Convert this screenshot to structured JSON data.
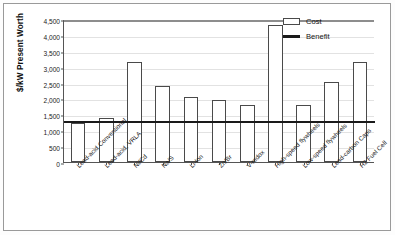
{
  "chart_data": {
    "type": "bar",
    "title": "",
    "xlabel": "",
    "ylabel": "$/kW Present Worth",
    "ylim": [
      0,
      4500
    ],
    "ytick_step": 500,
    "ytick_labels": [
      "4,500",
      "4,000",
      "3,500",
      "3,000",
      "2,500",
      "2,000",
      "1,500",
      "1,000",
      "500",
      "0"
    ],
    "ytick_values": [
      4500,
      4000,
      3500,
      3000,
      2500,
      2000,
      1500,
      1000,
      500,
      0
    ],
    "grid": true,
    "legend_position": "top-right",
    "categories": [
      "Lead-acid Conventional",
      "Lead-acid, VRLA",
      "Ni/Cd",
      "Na/S",
      "Li-Ion",
      "Zn/Br",
      "V-redox",
      "High-speed flywheels",
      "Low-speed flywheels",
      "Lead-carbon Caps",
      "H2 Fuel Cell"
    ],
    "series": [
      {
        "name": "Cost",
        "type": "bar",
        "color": "#ffffff",
        "edge_color": "#4a4a4a",
        "values": [
          1230,
          1380,
          3150,
          2380,
          2050,
          1960,
          1780,
          4300,
          1800,
          2520,
          3150
        ]
      },
      {
        "name": "Benefit",
        "type": "reference-line",
        "color": "#1a1a1a",
        "value": 1260
      }
    ]
  },
  "legend": {
    "items": [
      {
        "label": "Cost",
        "marker": "bar-swatch"
      },
      {
        "label": "Benefit",
        "marker": "line-swatch"
      }
    ]
  }
}
